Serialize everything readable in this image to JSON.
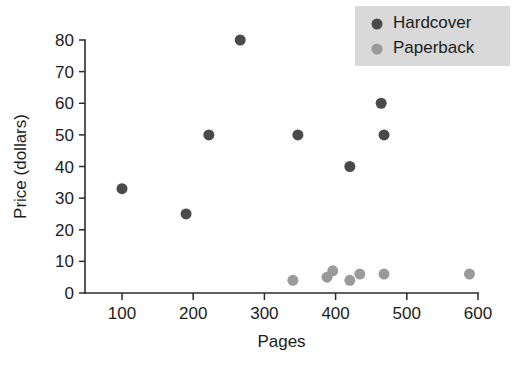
{
  "chart_data": {
    "type": "scatter",
    "title": "",
    "xlabel": "Pages",
    "ylabel": "Price (dollars)",
    "xlim": [
      50,
      625
    ],
    "ylim": [
      0,
      83
    ],
    "xticks": [
      100,
      200,
      300,
      400,
      500,
      600
    ],
    "yticks": [
      0,
      10,
      20,
      30,
      40,
      50,
      60,
      70,
      80
    ],
    "xtick_labels": [
      "100",
      "200",
      "300",
      "400",
      "500",
      "600"
    ],
    "ytick_labels": [
      "0",
      "10",
      "20",
      "30",
      "40",
      "50",
      "60",
      "70",
      "80"
    ],
    "grid": false,
    "legend_position": "top-right",
    "series": [
      {
        "name": "Hardcover",
        "color": "#4a4a4a",
        "marker": "circle",
        "marker_size": 11,
        "points": [
          {
            "x": 100,
            "y": 33
          },
          {
            "x": 190,
            "y": 25
          },
          {
            "x": 222,
            "y": 50
          },
          {
            "x": 266,
            "y": 80
          },
          {
            "x": 347,
            "y": 50
          },
          {
            "x": 420,
            "y": 40
          },
          {
            "x": 464,
            "y": 60
          },
          {
            "x": 468,
            "y": 50
          }
        ]
      },
      {
        "name": "Paperback",
        "color": "#9a9a9a",
        "marker": "circle",
        "marker_size": 11,
        "points": [
          {
            "x": 340,
            "y": 4
          },
          {
            "x": 388,
            "y": 5
          },
          {
            "x": 396,
            "y": 7
          },
          {
            "x": 420,
            "y": 4
          },
          {
            "x": 434,
            "y": 6
          },
          {
            "x": 468,
            "y": 6
          },
          {
            "x": 588,
            "y": 6
          }
        ]
      }
    ]
  },
  "legend": {
    "entries": [
      {
        "label": "Hardcover",
        "color": "#4a4a4a"
      },
      {
        "label": "Paperback",
        "color": "#9a9a9a"
      }
    ],
    "background": "#d9d9d9"
  },
  "axes": {
    "x_title": "Pages",
    "y_title": "Price (dollars)"
  }
}
